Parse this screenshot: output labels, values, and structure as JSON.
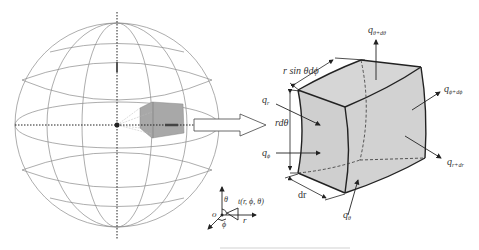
{
  "diagram": {
    "type": "spherical-coordinate-heat-conduction-element",
    "sphere": {
      "center": [
        117,
        125
      ],
      "radius": 102,
      "grid_color": "#888888",
      "shaded_element_color": "#a8a8a8"
    },
    "element": {
      "fill": "#d4d4d4",
      "edge_color": "#222222"
    },
    "labels": {
      "r_sin_theta_dphi": "r sin θdϕ",
      "r_dtheta": "rdθ",
      "dr": "dr",
      "q_r": "q",
      "q_r_sub": "r",
      "q_phi": "q",
      "q_phi_sub": "ϕ",
      "q_theta": "q",
      "q_theta_sub": "θ",
      "q_theta_dtheta": "q",
      "q_theta_dtheta_sub": "θ+dθ",
      "q_phi_dphi": "q",
      "q_phi_dphi_sub": "ϕ+dϕ",
      "q_r_dr": "q",
      "q_r_dr_sub": "r+dr"
    },
    "coord_axes": {
      "origin": "o",
      "theta": "θ",
      "phi": "ϕ",
      "r": "r",
      "point": "t(r, ϕ, θ)"
    }
  }
}
